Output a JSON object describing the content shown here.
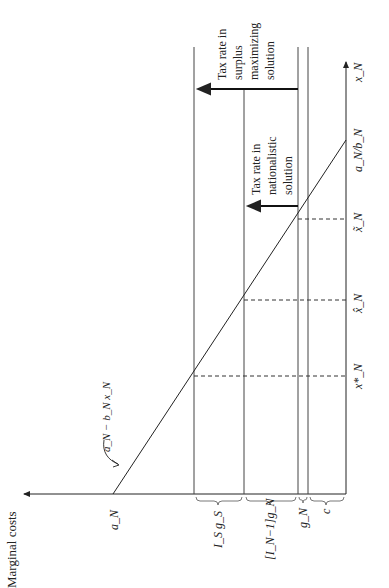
{
  "figure": {
    "y_axis_label": "Marginal costs",
    "x_axis_label": "x_N",
    "curve_label": "a_N − b_N x_N",
    "intercept_label": "a_N",
    "x_intercept_label": "a_N/b_N",
    "points": {
      "x_star": "x*_N",
      "x_hat": "x̂_N",
      "x_tilde": "x̃_N"
    },
    "brackets": {
      "c": "c",
      "gN": "g_N",
      "IN_minus_1_gN": "[I_N−1]g_N",
      "IS_gS": "I_S g_S"
    },
    "annotations": {
      "surplus": [
        "Tax rate in",
        "surplus",
        "maximizing",
        "solution"
      ],
      "nationalistic": [
        "Tax rate in",
        "nationalistic",
        "solution"
      ]
    },
    "colors": {
      "line": "#222222",
      "dashed": "#333333"
    }
  }
}
